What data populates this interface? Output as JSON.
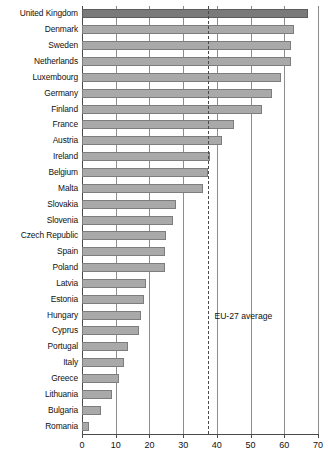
{
  "chart_data": {
    "type": "bar",
    "orientation": "horizontal",
    "title": "",
    "subtitle": "",
    "xlabel": "",
    "ylabel": "",
    "xlim": [
      0,
      70
    ],
    "xticks": [
      0,
      10,
      20,
      30,
      40,
      50,
      60,
      70
    ],
    "xtick_labels": [
      "0",
      "10",
      "20",
      "30",
      "40",
      "50",
      "60",
      "70"
    ],
    "grid": true,
    "grid_axis": "x",
    "legend": "none",
    "categories": [
      "United Kingdom",
      "Denmark",
      "Sweden",
      "Netherlands",
      "Luxembourg",
      "Germany",
      "Finland",
      "France",
      "Austria",
      "Ireland",
      "Belgium",
      "Malta",
      "Slovakia",
      "Slovenia",
      "Czech Republic",
      "Spain",
      "Poland",
      "Latvia",
      "Estonia",
      "Hungary",
      "Cyprus",
      "Portugal",
      "Italy",
      "Greece",
      "Lithuania",
      "Bulgaria",
      "Romania"
    ],
    "values": [
      67.0,
      63.0,
      62.0,
      62.0,
      59.0,
      56.5,
      53.5,
      45.0,
      41.5,
      38.0,
      37.5,
      36.0,
      28.0,
      27.0,
      25.0,
      24.5,
      24.5,
      19.0,
      18.5,
      17.5,
      17.0,
      13.5,
      12.5,
      11.0,
      9.0,
      5.5,
      2.0
    ],
    "highlight_category": "United Kingdom",
    "annotations": [
      {
        "name": "eu-27-average",
        "label": "EU-27 average",
        "value": 37.5,
        "style": "dashed-vertical-line"
      }
    ],
    "colors": {
      "bar": "#a9a9a9",
      "bar_border": "#7d7d7d",
      "bar_highlight": "#7a7a7a",
      "bar_highlight_border": "#5c5c5c",
      "gridline": "#8d8d8d",
      "axis": "#4a4a4a",
      "text": "#111111",
      "background": "#ffffff"
    }
  }
}
